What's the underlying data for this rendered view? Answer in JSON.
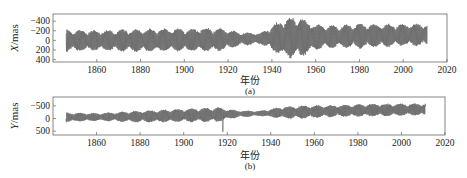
{
  "chart_data": [
    {
      "type": "line",
      "panel_label": "(a)",
      "title": "",
      "xlabel": "年份",
      "ylabel": "X/mas",
      "xlim": [
        1840,
        2020
      ],
      "ylim": [
        -450,
        550
      ],
      "xticks": [
        1860,
        1880,
        1900,
        1920,
        1940,
        1960,
        1980,
        2000,
        2020
      ],
      "yticks": [
        -400,
        -200,
        0,
        200,
        400
      ],
      "grid": false,
      "data_range_years": [
        1846,
        2011
      ],
      "description": "Polar motion X component, beating Chandler+annual wobble, amplitude ~±250 mas early, ~±100 mas near 1925-1935, peaks ~±450 mas near 1950, ~±250 mas later; mean drifts from ~0 to ~+100 mas",
      "series": [
        {
          "name": "X",
          "color": "#444444",
          "envelope": {
            "x": [
              1846,
              1860,
              1880,
              1900,
              1915,
              1925,
              1935,
              1945,
              1952,
              1960,
              1970,
              1980,
              1990,
              2000,
              2011
            ],
            "amplitude": [
              220,
              200,
              230,
              220,
              240,
              140,
              110,
              380,
              420,
              250,
              220,
              250,
              230,
              220,
              220
            ],
            "mean": [
              0,
              0,
              0,
              10,
              20,
              30,
              40,
              50,
              60,
              70,
              80,
              90,
              100,
              110,
              120
            ]
          }
        }
      ]
    },
    {
      "type": "line",
      "panel_label": "(b)",
      "title": "",
      "xlabel": "年份",
      "ylabel": "Y/mas",
      "xlim": [
        1840,
        2020
      ],
      "ylim": [
        -650,
        850
      ],
      "xticks": [
        1860,
        1880,
        1900,
        1920,
        1940,
        1960,
        1980,
        2000,
        2020
      ],
      "yticks": [
        -500,
        0,
        500
      ],
      "grid": false,
      "data_range_years": [
        1846,
        2011
      ],
      "description": "Polar motion Y component, amplitude ~±250 mas with slow upward drift to ~+350 mas mean; spike down ~-500 near 1918",
      "series": [
        {
          "name": "Y",
          "color": "#444444",
          "envelope": {
            "x": [
              1846,
              1860,
              1880,
              1900,
              1915,
              1925,
              1935,
              1945,
              1955,
              1970,
              1985,
              2000,
              2011
            ],
            "amplitude": [
              180,
              150,
              220,
              250,
              280,
              130,
              100,
              220,
              250,
              220,
              240,
              230,
              230
            ],
            "mean": [
              50,
              60,
              80,
              120,
              150,
              180,
              200,
              230,
              260,
              300,
              330,
              350,
              360
            ]
          }
        }
      ]
    }
  ],
  "panels": {
    "a": {
      "ylabel_italic": "X",
      "ylabel_unit": "/mas",
      "xlabel": "年份",
      "caption": "(a)",
      "ytick_labels": [
        "400",
        "200",
        "0",
        "−200",
        "−400"
      ],
      "xtick_labels": [
        "1860",
        "1880",
        "1900",
        "1920",
        "1940",
        "1960",
        "1980",
        "2000",
        "2020"
      ]
    },
    "b": {
      "ylabel_italic": "Y",
      "ylabel_unit": "/mas",
      "xlabel": "年份",
      "caption": "(b)",
      "ytick_labels": [
        "500",
        "0",
        "−500"
      ],
      "xtick_labels": [
        "1860",
        "1880",
        "1900",
        "1920",
        "1940",
        "1960",
        "1980",
        "2000",
        "2020"
      ]
    }
  },
  "colors": {
    "line": "#4a4a4a",
    "axis": "#555555",
    "text": "#222222"
  }
}
